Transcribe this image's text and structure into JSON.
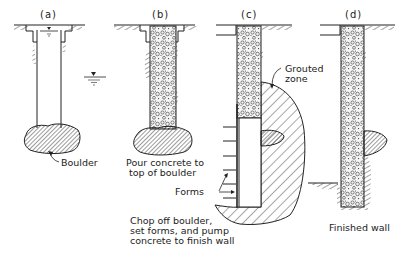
{
  "figure": {
    "panels": [
      {
        "id": "a",
        "label": "(a)"
      },
      {
        "id": "b",
        "label": "(b)"
      },
      {
        "id": "c",
        "label": "(c)"
      },
      {
        "id": "d",
        "label": "(d)"
      }
    ],
    "annotations": {
      "boulder": "Boulder",
      "pour_line1": "Pour concrete to",
      "pour_line2": "top of boulder",
      "grouted_line1": "Grouted",
      "grouted_line2": "zone",
      "forms": "Forms",
      "chop_line1": "Chop off boulder,",
      "chop_line2": "set forms, and pump",
      "chop_line3": "concrete to finish wall",
      "finished": "Finished wall"
    },
    "colors": {
      "ink": "#222222",
      "background": "#ffffff"
    }
  }
}
